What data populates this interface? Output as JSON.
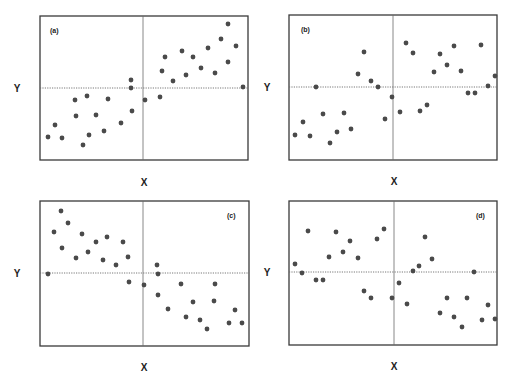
{
  "figure": {
    "panels": [
      {
        "id": "a",
        "label": "(a)",
        "xlabel": "X",
        "ylabel": "Y",
        "frame": {
          "x": 40,
          "y": 16,
          "w": 208,
          "h": 144
        },
        "cross": {
          "vx": 143,
          "hy": 88
        },
        "label_pos": {
          "x": 50,
          "y": 33
        },
        "xlabel_pos": {
          "x": 144,
          "y": 186
        },
        "ylabel_pos": {
          "x": 17,
          "y": 92
        }
      },
      {
        "id": "b",
        "label": "(b)",
        "xlabel": "X",
        "ylabel": "Y",
        "frame": {
          "x": 289,
          "y": 15,
          "w": 208,
          "h": 145
        },
        "cross": {
          "vx": 393,
          "hy": 87
        },
        "label_pos": {
          "x": 301,
          "y": 32
        },
        "xlabel_pos": {
          "x": 394,
          "y": 185
        },
        "ylabel_pos": {
          "x": 267,
          "y": 91
        }
      },
      {
        "id": "c",
        "label": "(c)",
        "xlabel": "X",
        "ylabel": "Y",
        "frame": {
          "x": 40,
          "y": 201,
          "w": 209,
          "h": 145
        },
        "cross": {
          "vx": 143,
          "hy": 273
        },
        "label_pos": {
          "x": 227,
          "y": 218
        },
        "xlabel_pos": {
          "x": 144,
          "y": 371
        },
        "ylabel_pos": {
          "x": 17,
          "y": 277
        }
      },
      {
        "id": "d",
        "label": "(d)",
        "xlabel": "X",
        "ylabel": "Y",
        "frame": {
          "x": 289,
          "y": 201,
          "w": 208,
          "h": 144
        },
        "cross": {
          "vx": 394,
          "hy": 272
        },
        "label_pos": {
          "x": 476,
          "y": 218
        },
        "xlabel_pos": {
          "x": 394,
          "y": 370
        },
        "ylabel_pos": {
          "x": 267,
          "y": 276
        }
      }
    ]
  },
  "chart_data": [
    {
      "type": "scatter",
      "title": "(a)",
      "xlabel": "X",
      "ylabel": "Y",
      "grid": false,
      "reference_lines": "dotted horizontal and vertical lines through the center (mean)",
      "trend": "positive",
      "points_px": [
        [
          48,
          137
        ],
        [
          55,
          125
        ],
        [
          62,
          138
        ],
        [
          75,
          100
        ],
        [
          76,
          116
        ],
        [
          83,
          145
        ],
        [
          87,
          96
        ],
        [
          89,
          135
        ],
        [
          96,
          115
        ],
        [
          104,
          131
        ],
        [
          108,
          99
        ],
        [
          121,
          123
        ],
        [
          131,
          80
        ],
        [
          131,
          88
        ],
        [
          132,
          111
        ],
        [
          145,
          100
        ],
        [
          160,
          97
        ],
        [
          162,
          71
        ],
        [
          165,
          57
        ],
        [
          173,
          81
        ],
        [
          182,
          51
        ],
        [
          186,
          75
        ],
        [
          193,
          57
        ],
        [
          201,
          68
        ],
        [
          208,
          48
        ],
        [
          215,
          73
        ],
        [
          221,
          39
        ],
        [
          228,
          24
        ],
        [
          228,
          62
        ],
        [
          236,
          46
        ],
        [
          243,
          87
        ]
      ]
    },
    {
      "type": "scatter",
      "title": "(b)",
      "xlabel": "X",
      "ylabel": "Y",
      "grid": false,
      "reference_lines": "dotted horizontal and vertical lines through the center (mean)",
      "trend": "weak positive",
      "points_px": [
        [
          295,
          135
        ],
        [
          303,
          122
        ],
        [
          310,
          136
        ],
        [
          316,
          87
        ],
        [
          323,
          114
        ],
        [
          330,
          143
        ],
        [
          337,
          132
        ],
        [
          344,
          113
        ],
        [
          351,
          129
        ],
        [
          358,
          74
        ],
        [
          364,
          52
        ],
        [
          371,
          81
        ],
        [
          378,
          87
        ],
        [
          385,
          119
        ],
        [
          392,
          97
        ],
        [
          400,
          112
        ],
        [
          406,
          43
        ],
        [
          413,
          53
        ],
        [
          420,
          111
        ],
        [
          427,
          105
        ],
        [
          434,
          72
        ],
        [
          440,
          54
        ],
        [
          447,
          65
        ],
        [
          454,
          46
        ],
        [
          461,
          71
        ],
        [
          468,
          93
        ],
        [
          475,
          93
        ],
        [
          481,
          45
        ],
        [
          488,
          86
        ],
        [
          495,
          76
        ]
      ]
    },
    {
      "type": "scatter",
      "title": "(c)",
      "xlabel": "X",
      "ylabel": "Y",
      "grid": false,
      "reference_lines": "dotted horizontal and vertical lines through the center (mean)",
      "trend": "negative",
      "points_px": [
        [
          48,
          274
        ],
        [
          54,
          232
        ],
        [
          61,
          211
        ],
        [
          62,
          248
        ],
        [
          68,
          223
        ],
        [
          76,
          258
        ],
        [
          82,
          234
        ],
        [
          88,
          252
        ],
        [
          96,
          242
        ],
        [
          103,
          260
        ],
        [
          107,
          237
        ],
        [
          116,
          265
        ],
        [
          123,
          242
        ],
        [
          128,
          257
        ],
        [
          129,
          282
        ],
        [
          144,
          285
        ],
        [
          157,
          265
        ],
        [
          158,
          274
        ],
        [
          158,
          295
        ],
        [
          168,
          309
        ],
        [
          181,
          284
        ],
        [
          186,
          317
        ],
        [
          193,
          302
        ],
        [
          200,
          320
        ],
        [
          207,
          329
        ],
        [
          215,
          284
        ],
        [
          214,
          301
        ],
        [
          229,
          323
        ],
        [
          235,
          310
        ],
        [
          242,
          323
        ]
      ]
    },
    {
      "type": "scatter",
      "title": "(d)",
      "xlabel": "X",
      "ylabel": "Y",
      "grid": false,
      "reference_lines": "dotted horizontal and vertical lines through the center (mean)",
      "trend": "weak negative",
      "points_px": [
        [
          295,
          264
        ],
        [
          302,
          273
        ],
        [
          308,
          231
        ],
        [
          316,
          280
        ],
        [
          323,
          280
        ],
        [
          329,
          257
        ],
        [
          336,
          232
        ],
        [
          343,
          252
        ],
        [
          350,
          241
        ],
        [
          358,
          258
        ],
        [
          364,
          291
        ],
        [
          371,
          298
        ],
        [
          377,
          239
        ],
        [
          384,
          229
        ],
        [
          392,
          298
        ],
        [
          399,
          283
        ],
        [
          407,
          304
        ],
        [
          413,
          271
        ],
        [
          419,
          266
        ],
        [
          425,
          237
        ],
        [
          432,
          259
        ],
        [
          440,
          313
        ],
        [
          447,
          298
        ],
        [
          454,
          317
        ],
        [
          462,
          327
        ],
        [
          467,
          298
        ],
        [
          474,
          272
        ],
        [
          482,
          320
        ],
        [
          488,
          305
        ],
        [
          495,
          319
        ]
      ]
    }
  ]
}
